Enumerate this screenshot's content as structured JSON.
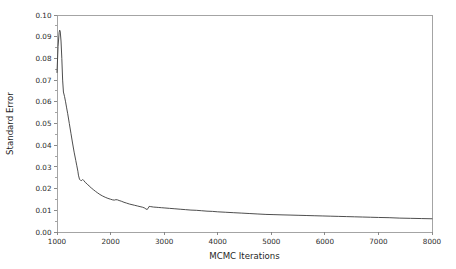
{
  "chart_data": {
    "type": "line",
    "title": "",
    "xlabel": "MCMC Iterations",
    "ylabel": "Standard Error",
    "xlim": [
      1000,
      8000
    ],
    "ylim": [
      0.0,
      0.1
    ],
    "xticks": [
      1000,
      2000,
      3000,
      4000,
      5000,
      6000,
      7000,
      8000
    ],
    "xtick_labels": [
      "1000",
      "2000",
      "3000",
      "4000",
      "5000",
      "6000",
      "7000",
      "8000"
    ],
    "yticks": [
      0.0,
      0.01,
      0.02,
      0.03,
      0.04,
      0.05,
      0.06,
      0.07,
      0.08,
      0.09,
      0.1
    ],
    "ytick_labels": [
      "0.00",
      "0.01",
      "0.02",
      "0.03",
      "0.04",
      "0.05",
      "0.06",
      "0.07",
      "0.08",
      "0.09",
      "0.10"
    ],
    "grid": false,
    "legend": null,
    "series": [
      {
        "name": "Standard Error",
        "color": "#3a3a3a",
        "x": [
          1000,
          1020,
          1040,
          1050,
          1060,
          1075,
          1090,
          1105,
          1120,
          1140,
          1160,
          1180,
          1200,
          1230,
          1260,
          1290,
          1320,
          1350,
          1370,
          1390,
          1400,
          1420,
          1440,
          1460,
          1480,
          1500,
          1530,
          1560,
          1600,
          1640,
          1680,
          1720,
          1760,
          1800,
          1850,
          1900,
          1950,
          2000,
          2040,
          2070,
          2100,
          2130,
          2160,
          2200,
          2250,
          2300,
          2350,
          2400,
          2450,
          2500,
          2550,
          2600,
          2640,
          2660,
          2680,
          2700,
          2720,
          2750,
          2800,
          2850,
          2900,
          2950,
          3000,
          3100,
          3200,
          3300,
          3400,
          3500,
          3600,
          3700,
          3800,
          3900,
          4000,
          4150,
          4300,
          4450,
          4600,
          4750,
          4900,
          5050,
          5200,
          5350,
          5500,
          5650,
          5800,
          5950,
          6100,
          6250,
          6400,
          6550,
          6700,
          6850,
          7000,
          7200,
          7400,
          7600,
          7800,
          8000
        ],
        "y": [
          0.0735,
          0.0855,
          0.092,
          0.093,
          0.0925,
          0.088,
          0.08,
          0.07,
          0.0645,
          0.0625,
          0.06,
          0.0572,
          0.0545,
          0.05,
          0.0455,
          0.041,
          0.0368,
          0.033,
          0.0305,
          0.028,
          0.0262,
          0.0243,
          0.0238,
          0.0237,
          0.0242,
          0.0237,
          0.0228,
          0.0222,
          0.0212,
          0.0203,
          0.0195,
          0.0187,
          0.018,
          0.0173,
          0.0166,
          0.016,
          0.0155,
          0.0151,
          0.0148,
          0.0147,
          0.0149,
          0.0148,
          0.0145,
          0.0142,
          0.0137,
          0.0133,
          0.0129,
          0.0126,
          0.0123,
          0.012,
          0.0117,
          0.0114,
          0.011,
          0.0106,
          0.0104,
          0.0108,
          0.0118,
          0.0117,
          0.0115,
          0.0114,
          0.0113,
          0.0112,
          0.0111,
          0.0109,
          0.0107,
          0.0105,
          0.0103,
          0.0101,
          0.01,
          0.0098,
          0.0096,
          0.0095,
          0.0093,
          0.0091,
          0.0089,
          0.0087,
          0.0085,
          0.0083,
          0.0081,
          0.008,
          0.0079,
          0.0078,
          0.0077,
          0.0076,
          0.0075,
          0.0074,
          0.0073,
          0.0072,
          0.0071,
          0.007,
          0.0069,
          0.0068,
          0.0067,
          0.0066,
          0.0064,
          0.0063,
          0.0062,
          0.0061
        ]
      }
    ],
    "style": {
      "axis_color": "#9a9a9a",
      "tick_color": "#7d7d7d",
      "text_color": "#2b2b2b",
      "background": "#ffffff",
      "line_width": 0.9
    },
    "geometry": {
      "plot_left": 57,
      "plot_right": 432,
      "plot_top": 15,
      "plot_bottom": 232
    }
  }
}
